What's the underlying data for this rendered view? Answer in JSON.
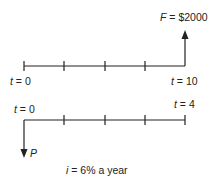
{
  "top": {
    "future_label_var": "F",
    "future_label_value": " = $2000",
    "start_var": "t",
    "start_value": " = 0",
    "end_var": "t",
    "end_value": " = 10"
  },
  "bottom": {
    "start_var": "t",
    "start_value": " = 0",
    "end_var": "t",
    "end_value": " = 4",
    "present_label": "P"
  },
  "rate": {
    "var": "i",
    "value": " = 6% a year"
  },
  "colors": {
    "line": "#222222"
  }
}
